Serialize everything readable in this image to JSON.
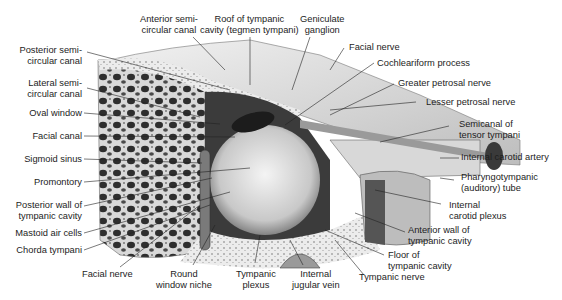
{
  "figure": {
    "colors": {
      "background": "#ffffff",
      "bone": "#e8e8e8",
      "shadow": "#3a3a3a",
      "leader": "#222222",
      "text": "#1d1d1d"
    }
  },
  "labels": {
    "top": [
      {
        "id": "anterior-semicircular-canal",
        "lines": [
          "Anterior semi-",
          "circular canal"
        ]
      },
      {
        "id": "roof-of-tympanic-cavity",
        "lines": [
          "Roof of tympanic",
          "cavity (tegmen tympani)"
        ]
      },
      {
        "id": "geniculate-ganglion",
        "lines": [
          "Geniculate",
          "ganglion"
        ]
      }
    ],
    "left": [
      {
        "id": "posterior-semicircular-canal",
        "lines": [
          "Posterior semi-",
          "circular canal"
        ]
      },
      {
        "id": "lateral-semicircular-canal",
        "lines": [
          "Lateral semi-",
          "circular canal"
        ]
      },
      {
        "id": "oval-window",
        "lines": [
          "Oval window"
        ]
      },
      {
        "id": "facial-canal",
        "lines": [
          "Facial canal"
        ]
      },
      {
        "id": "sigmoid-sinus",
        "lines": [
          "Sigmoid sinus"
        ]
      },
      {
        "id": "promontory",
        "lines": [
          "Promontory"
        ]
      },
      {
        "id": "posterior-wall",
        "lines": [
          "Posterior wall of",
          "tympanic cavity"
        ]
      },
      {
        "id": "mastoid-air-cells",
        "lines": [
          "Mastoid air cells"
        ]
      },
      {
        "id": "chorda-tympani",
        "lines": [
          "Chorda tympani"
        ]
      }
    ],
    "right": [
      {
        "id": "facial-nerve-top",
        "lines": [
          "Facial nerve"
        ]
      },
      {
        "id": "cochleariform-process",
        "lines": [
          "Cochleariform process"
        ]
      },
      {
        "id": "greater-petrosal-nerve",
        "lines": [
          "Greater petrosal nerve"
        ]
      },
      {
        "id": "lesser-petrosal-nerve",
        "lines": [
          "Lesser petrosal nerve"
        ]
      },
      {
        "id": "semicanal-tensor-tympani",
        "lines": [
          "Semicanal of",
          "tensor tympani"
        ]
      },
      {
        "id": "internal-carotid-artery",
        "lines": [
          "Internal carotid artery"
        ]
      },
      {
        "id": "pharyngotympanic-tube",
        "lines": [
          "Pharyngotympanic",
          "(auditory) tube"
        ]
      },
      {
        "id": "internal-carotid-plexus",
        "lines": [
          "Internal",
          "carotid plexus"
        ]
      },
      {
        "id": "anterior-wall",
        "lines": [
          "Anterior wall of",
          "tympanic cavity"
        ]
      },
      {
        "id": "floor-of-tympanic-cavity",
        "lines": [
          "Floor of",
          "tympanic cavity"
        ]
      },
      {
        "id": "tympanic-nerve",
        "lines": [
          "Tympanic nerve"
        ]
      }
    ],
    "bottom": [
      {
        "id": "facial-nerve-bottom",
        "lines": [
          "Facial nerve"
        ]
      },
      {
        "id": "round-window-niche",
        "lines": [
          "Round",
          "window niche"
        ]
      },
      {
        "id": "tympanic-plexus",
        "lines": [
          "Tympanic",
          "plexus"
        ]
      },
      {
        "id": "internal-jugular-vein",
        "lines": [
          "Internal",
          "jugular vein"
        ]
      }
    ]
  }
}
